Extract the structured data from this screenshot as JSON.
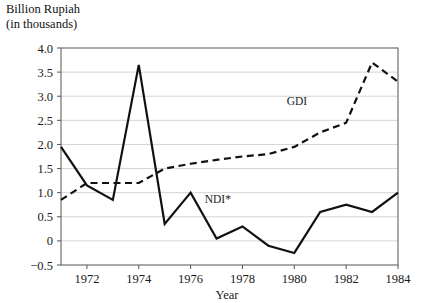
{
  "chart_data": {
    "type": "line",
    "title": "",
    "ylabel_line1": "Billion Rupiah",
    "ylabel_line2": "(in thousands)",
    "xlabel": "Year",
    "xlim": [
      1971,
      1984
    ],
    "ylim": [
      -0.5,
      4.0
    ],
    "grid": true,
    "legend_position": "inline-annotations",
    "x": [
      1971,
      1972,
      1973,
      1974,
      1975,
      1976,
      1977,
      1978,
      1979,
      1980,
      1981,
      1982,
      1983,
      1984
    ],
    "ytick_labels": [
      "4.0",
      "3.5",
      "3.0",
      "2.5",
      "2.0",
      "1.5",
      "1.0",
      "0.5",
      "0",
      "-0.5"
    ],
    "ytick_values": [
      4.0,
      3.5,
      3.0,
      2.5,
      2.0,
      1.5,
      1.0,
      0.5,
      0,
      -0.5
    ],
    "xtick_labels": [
      "1972",
      "1974",
      "1976",
      "1978",
      "1980",
      "1982",
      "1984"
    ],
    "xtick_values": [
      1972,
      1974,
      1976,
      1978,
      1980,
      1982,
      1984
    ],
    "series": [
      {
        "name": "NDI*",
        "label": "NDI*",
        "style": "solid",
        "color": "#111111",
        "label_x": 1977.05,
        "label_y": 0.78,
        "values": [
          1.95,
          1.15,
          0.85,
          3.65,
          0.35,
          1.0,
          0.05,
          0.3,
          -0.1,
          -0.25,
          0.6,
          0.75,
          0.6,
          1.0
        ]
      },
      {
        "name": "GDI",
        "label": "GDI",
        "style": "dashed",
        "color": "#111111",
        "label_x": 1980.1,
        "label_y": 2.82,
        "values": [
          0.85,
          1.2,
          1.2,
          1.2,
          1.5,
          1.6,
          1.68,
          1.75,
          1.8,
          1.95,
          2.25,
          2.45,
          3.7,
          3.3
        ]
      }
    ]
  }
}
